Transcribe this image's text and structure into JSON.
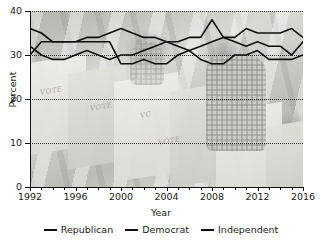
{
  "chart_data": {
    "type": "line",
    "title": "",
    "xlabel": "Year",
    "ylabel": "Percent",
    "xlim": [
      1992,
      2016
    ],
    "ylim": [
      0,
      40
    ],
    "xticks": [
      1992,
      1996,
      2000,
      2004,
      2008,
      2012,
      2016
    ],
    "yticks": [
      0,
      10,
      20,
      30,
      40
    ],
    "grid": "horizontal-dotted",
    "legend_position": "bottom",
    "x": [
      1992,
      1993,
      1994,
      1995,
      1996,
      1997,
      1998,
      1999,
      2000,
      2001,
      2002,
      2003,
      2004,
      2005,
      2006,
      2007,
      2008,
      2009,
      2010,
      2011,
      2012,
      2013,
      2014,
      2015,
      2016
    ],
    "series": [
      {
        "name": "Republican",
        "color": "#101010",
        "values": [
          36,
          35,
          33,
          33,
          33,
          34,
          34,
          35,
          36,
          35,
          34,
          34,
          33,
          32,
          31,
          29,
          28,
          28,
          30,
          30,
          31,
          29,
          29,
          29,
          30
        ]
      },
      {
        "name": "Democrat",
        "color": "#101010",
        "values": [
          32,
          30,
          29,
          29,
          30,
          31,
          30,
          29,
          30,
          30,
          31,
          32,
          33,
          33,
          34,
          34,
          38,
          34,
          33,
          32,
          33,
          32,
          32,
          30,
          33
        ]
      },
      {
        "name": "Independent",
        "color": "#101010",
        "values": [
          30,
          33,
          33,
          33,
          33,
          33,
          33,
          33,
          28,
          28,
          29,
          28,
          28,
          30,
          31,
          32,
          33,
          34,
          34,
          36,
          35,
          35,
          35,
          36,
          34
        ]
      }
    ]
  },
  "axes": {
    "x_title": "Year",
    "y_title": "Percent",
    "x_tick_labels": [
      "1992",
      "1996",
      "2000",
      "2004",
      "2008",
      "2012",
      "2016"
    ],
    "y_tick_labels": [
      "0",
      "10",
      "20",
      "30",
      "40"
    ]
  },
  "legend": {
    "items": [
      {
        "label": "Republican"
      },
      {
        "label": "Democrat"
      },
      {
        "label": "Independent"
      }
    ]
  },
  "background": {
    "description": "faded photograph of voters at voting booths",
    "booth_text": [
      "VOTE",
      "VOTE",
      "VC",
      "VOTE",
      "VC"
    ]
  }
}
